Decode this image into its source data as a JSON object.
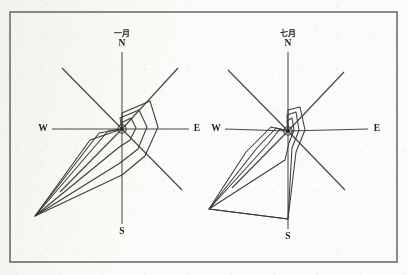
{
  "figure": {
    "background_color": "#fbfbf9",
    "ink_color": "#3b3b3b",
    "frame_color": "#6f6f6f",
    "frame": {
      "x": 10,
      "y": 12,
      "width": 387,
      "height": 250
    }
  },
  "chart_data": {
    "type": "line",
    "title": "",
    "subplots": [
      {
        "id": "january",
        "month_label": "一月",
        "month_label_romanized": "January",
        "center": {
          "x": 122,
          "y": 129
        },
        "cardinals": [
          {
            "name": "N",
            "label": "N",
            "x": 122,
            "y": 44
          },
          {
            "name": "S",
            "label": "S",
            "x": 122,
            "y": 232
          },
          {
            "name": "W",
            "label": "W",
            "x": 43,
            "y": 129
          },
          {
            "name": "E",
            "label": "E",
            "x": 197,
            "y": 129
          }
        ],
        "month_label_pos": {
          "x": 122,
          "y": 33
        },
        "axes": [
          {
            "dir": "N",
            "x1": 122,
            "y1": 129,
            "x2": 122,
            "y2": 52
          },
          {
            "dir": "S",
            "x1": 122,
            "y1": 129,
            "x2": 122,
            "y2": 224
          },
          {
            "dir": "W",
            "x1": 122,
            "y1": 129,
            "x2": 52,
            "y2": 129
          },
          {
            "dir": "E",
            "x1": 122,
            "y1": 129,
            "x2": 189,
            "y2": 129
          },
          {
            "dir": "NW",
            "x1": 122,
            "y1": 129,
            "x2": 62,
            "y2": 68
          },
          {
            "dir": "NE",
            "x1": 122,
            "y1": 129,
            "x2": 178,
            "y2": 68
          },
          {
            "dir": "SW",
            "x1": 122,
            "y1": 129,
            "x2": 60,
            "y2": 192
          },
          {
            "dir": "SE",
            "x1": 122,
            "y1": 129,
            "x2": 182,
            "y2": 190
          }
        ],
        "polygons": [
          {
            "name": "outer-trace",
            "points": "122,129 122,113 150,101 158,127 145,156 122,175 35,216 90,140 122,129"
          },
          {
            "name": "inner-trace",
            "points": "122,129 120,118 139,110 147,127 138,149 120,163 35,216 99,133 122,129"
          },
          {
            "name": "hub-trace",
            "points": "122,129 121,123 131,118 136,128 130,140 118,148 35,216 108,131 122,129"
          }
        ]
      },
      {
        "id": "july",
        "month_label": "七月",
        "month_label_romanized": "July",
        "center": {
          "x": 288,
          "y": 131
        },
        "cardinals": [
          {
            "name": "N",
            "label": "N",
            "x": 288,
            "y": 44
          },
          {
            "name": "S",
            "label": "S",
            "x": 288,
            "y": 237
          },
          {
            "name": "W",
            "label": "W",
            "x": 216,
            "y": 129
          },
          {
            "name": "E",
            "label": "E",
            "x": 377,
            "y": 129
          }
        ],
        "month_label_pos": {
          "x": 288,
          "y": 33
        },
        "axes": [
          {
            "dir": "N",
            "x1": 288,
            "y1": 131,
            "x2": 288,
            "y2": 52
          },
          {
            "dir": "S",
            "x1": 288,
            "y1": 131,
            "x2": 288,
            "y2": 229
          },
          {
            "dir": "W",
            "x1": 288,
            "y1": 131,
            "x2": 225,
            "y2": 129
          },
          {
            "dir": "E",
            "x1": 288,
            "y1": 131,
            "x2": 368,
            "y2": 129
          },
          {
            "dir": "NW",
            "x1": 288,
            "y1": 131,
            "x2": 228,
            "y2": 70
          },
          {
            "dir": "NE",
            "x1": 288,
            "y1": 131,
            "x2": 344,
            "y2": 72
          },
          {
            "dir": "SW",
            "x1": 288,
            "y1": 131,
            "x2": 232,
            "y2": 188
          },
          {
            "dir": "SE",
            "x1": 288,
            "y1": 131,
            "x2": 345,
            "y2": 190
          }
        ],
        "polygons": [
          {
            "name": "outer-trace",
            "points": "288,131 288,110 300,107 305,130 296,152 288,219 209,209 246,152 271,127 288,131"
          },
          {
            "name": "inner-trace",
            "points": "288,131 287,115 296,112 299,130 292,148 288,219 209,209 257,148 276,128 288,131"
          },
          {
            "name": "hub-trace",
            "points": "288,131 287,121 292,118 294,130 289,143 285,160 209,209 268,144 280,129 288,131"
          }
        ]
      }
    ]
  }
}
